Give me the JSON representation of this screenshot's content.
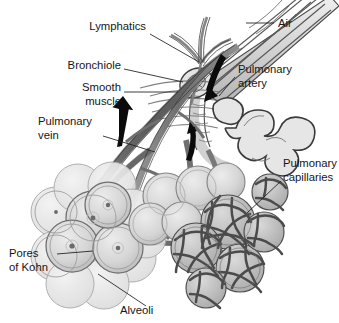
{
  "figure": {
    "background_color": "#ffffff",
    "ink_color": "#1b1b1b",
    "style": "grayscale line illustration"
  },
  "labels": [
    {
      "id": "lymphatics",
      "text": "Lymphatics",
      "lines": [
        "Lymphatics"
      ],
      "align": "end",
      "x": 146,
      "y": 30,
      "leader_from": [
        150,
        34
      ],
      "leader_to": [
        199,
        62
      ]
    },
    {
      "id": "bronchiole",
      "text": "Bronchiole",
      "lines": [
        "Bronchiole"
      ],
      "align": "end",
      "x": 120,
      "y": 65,
      "leader_from": [
        124,
        69
      ],
      "leader_to": [
        183,
        82
      ]
    },
    {
      "id": "smooth-muscle",
      "text": "Smooth muscle",
      "lines": [
        "Smooth",
        "muscle"
      ],
      "align": "end",
      "x": 120,
      "y": 94,
      "leader_from": [
        124,
        92
      ],
      "leader_to": [
        175,
        92
      ]
    },
    {
      "id": "pulmonary-vein",
      "text": "Pulmonary vein",
      "lines": [
        "Pulmonary",
        "vein"
      ],
      "align": "start",
      "x": 38,
      "y": 125,
      "leader_from": [
        103,
        136
      ],
      "leader_to": [
        155,
        152
      ]
    },
    {
      "id": "pores-of-kohn",
      "text": "Pores of Kohn",
      "lines": [
        "Pores",
        "of Kohn"
      ],
      "align": "start",
      "x": 9,
      "y": 257,
      "leader_from": [
        57,
        254
      ],
      "leader_to": [
        93,
        254
      ]
    },
    {
      "id": "alveoli",
      "text": "Alveoli",
      "lines": [
        "Alveoli"
      ],
      "align": "start",
      "x": 120,
      "y": 313,
      "leader_from": [
        146,
        306
      ],
      "leader_to": [
        98,
        274
      ]
    },
    {
      "id": "air",
      "text": "Air",
      "lines": [
        "Air"
      ],
      "align": "start",
      "x": 277,
      "y": 27,
      "leader_from": [
        274,
        23
      ],
      "leader_to": [
        245,
        23
      ]
    },
    {
      "id": "pulmonary-artery",
      "text": "Pulmonary artery",
      "lines": [
        "Pulmonary",
        "artery"
      ],
      "align": "start",
      "x": 238,
      "y": 73,
      "leader_from": [
        235,
        77
      ],
      "leader_to": [
        218,
        95
      ]
    },
    {
      "id": "pulmonary-capillaries",
      "text": "Pulmonary capillaries",
      "lines": [
        "Pulmonary",
        "capillaries"
      ],
      "align": "start",
      "x": 283,
      "y": 167,
      "leader_from": [
        281,
        181
      ],
      "leader_to": [
        247,
        213
      ]
    }
  ],
  "flow_arrows": [
    {
      "id": "vein-flow",
      "direction": "up",
      "description": "blood flow in pulmonary vein"
    },
    {
      "id": "artery-flow",
      "direction": "down-left",
      "description": "blood flow in pulmonary artery"
    },
    {
      "id": "central-flow",
      "direction": "up",
      "description": "blood flow toward alveolar capillaries"
    }
  ],
  "structures": [
    {
      "id": "bronchiole-tube",
      "name": "Bronchiole",
      "fill": "#d8d8d8"
    },
    {
      "id": "smooth-muscle-band",
      "name": "Smooth muscle bands",
      "fill": "#c4c4c4"
    },
    {
      "id": "alveolar-sac",
      "name": "Alveoli",
      "fill": "#d2d2d2"
    },
    {
      "id": "capillary-mesh",
      "name": "Pulmonary capillaries",
      "fill": "#6e6e6e"
    },
    {
      "id": "vessel",
      "name": "Blood vessels",
      "fill": "#8a8a8a"
    }
  ]
}
